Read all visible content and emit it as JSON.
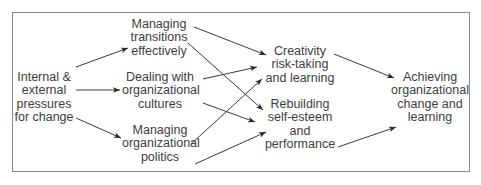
{
  "diagram": {
    "nodes": {
      "pressures": {
        "lines": [
          "Internal &",
          "external",
          "pressures",
          "for change"
        ]
      },
      "transitions": {
        "lines": [
          "Managing",
          "transitions",
          "effectively"
        ]
      },
      "cultures": {
        "lines": [
          "Dealing with",
          "organizational",
          "cultures"
        ]
      },
      "politics": {
        "lines": [
          "Managing",
          "organizational",
          "politics"
        ]
      },
      "creativity": {
        "lines": [
          "Creativity",
          "risk-taking",
          "and learning"
        ]
      },
      "rebuilding": {
        "lines": [
          "Rebuilding",
          "self-esteem",
          "and",
          "performance"
        ]
      },
      "achieving": {
        "lines": [
          "Achieving",
          "organizational",
          "change and",
          "learning"
        ]
      }
    },
    "edges": [
      {
        "from": "pressures",
        "to": "transitions"
      },
      {
        "from": "pressures",
        "to": "cultures"
      },
      {
        "from": "pressures",
        "to": "politics"
      },
      {
        "from": "transitions",
        "to": "creativity"
      },
      {
        "from": "transitions",
        "to": "rebuilding"
      },
      {
        "from": "cultures",
        "to": "creativity"
      },
      {
        "from": "cultures",
        "to": "rebuilding"
      },
      {
        "from": "politics",
        "to": "creativity"
      },
      {
        "from": "politics",
        "to": "rebuilding"
      },
      {
        "from": "creativity",
        "to": "achieving"
      },
      {
        "from": "rebuilding",
        "to": "achieving"
      }
    ],
    "colors": {
      "line": "#333333",
      "frame": "#8a8a8a",
      "text": "#3d3d3d"
    }
  }
}
